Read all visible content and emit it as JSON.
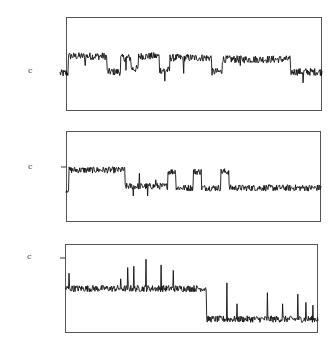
{
  "chart_data": [
    {
      "type": "line",
      "title": "",
      "xlabel": "",
      "ylabel": "",
      "level_label": "c",
      "grid": false,
      "ylim": [
        -1.2,
        1.8
      ],
      "xlim": [
        0,
        250
      ],
      "segments": [
        {
          "from": 0,
          "to": 8,
          "level": 0.0
        },
        {
          "from": 8,
          "to": 45,
          "level": 0.55
        },
        {
          "from": 45,
          "to": 58,
          "level": 0.05
        },
        {
          "from": 58,
          "to": 68,
          "level": 0.5
        },
        {
          "from": 68,
          "to": 75,
          "level": 0.15
        },
        {
          "from": 75,
          "to": 95,
          "level": 0.55
        },
        {
          "from": 95,
          "to": 105,
          "level": 0.1
        },
        {
          "from": 105,
          "to": 145,
          "level": 0.5
        },
        {
          "from": 145,
          "to": 155,
          "level": 0.05
        },
        {
          "from": 155,
          "to": 220,
          "level": 0.45
        },
        {
          "from": 220,
          "to": 250,
          "level": 0.05
        }
      ],
      "noise": 0.12,
      "spikes": [
        {
          "x": 24,
          "value": -0.3
        },
        {
          "x": 63,
          "value": -0.4
        },
        {
          "x": 100,
          "value": -0.35
        },
        {
          "x": 118,
          "value": -0.5
        },
        {
          "x": 172,
          "value": -0.2
        },
        {
          "x": 232,
          "value": -0.35
        }
      ]
    },
    {
      "type": "line",
      "title": "",
      "xlabel": "",
      "ylabel": "",
      "level_label": "c",
      "grid": false,
      "ylim": [
        -1.6,
        1.2
      ],
      "xlim": [
        0,
        250
      ],
      "segments": [
        {
          "from": 0,
          "to": 3,
          "level": -0.6
        },
        {
          "from": 3,
          "to": 58,
          "level": 0.0
        },
        {
          "from": 58,
          "to": 100,
          "level": -0.5
        },
        {
          "from": 100,
          "to": 108,
          "level": -0.05
        },
        {
          "from": 108,
          "to": 125,
          "level": -0.55
        },
        {
          "from": 125,
          "to": 133,
          "level": -0.05
        },
        {
          "from": 133,
          "to": 152,
          "level": -0.55
        },
        {
          "from": 152,
          "to": 160,
          "level": -0.05
        },
        {
          "from": 160,
          "to": 250,
          "level": -0.55
        }
      ],
      "noise": 0.1,
      "spikes": [
        {
          "x": 66,
          "value": -0.3
        },
        {
          "x": 72,
          "value": 0.4
        },
        {
          "x": 80,
          "value": -0.3
        },
        {
          "x": 88,
          "value": 0.2
        }
      ]
    },
    {
      "type": "line",
      "title": "",
      "xlabel": "",
      "ylabel": "",
      "level_label": "c",
      "grid": false,
      "ylim": [
        -2.6,
        0.6
      ],
      "xlim": [
        0,
        250
      ],
      "segments": [
        {
          "from": 0,
          "to": 140,
          "level": -1.0
        },
        {
          "from": 140,
          "to": 250,
          "level": -2.1
        }
      ],
      "noise": 0.12,
      "spikes": [
        {
          "x": 4,
          "value": 0.55
        },
        {
          "x": 55,
          "value": 0.35
        },
        {
          "x": 62,
          "value": 0.75
        },
        {
          "x": 68,
          "value": 0.8
        },
        {
          "x": 80,
          "value": 1.05
        },
        {
          "x": 95,
          "value": 0.85
        },
        {
          "x": 107,
          "value": 0.65
        },
        {
          "x": 160,
          "value": 1.3
        },
        {
          "x": 170,
          "value": 0.55
        },
        {
          "x": 200,
          "value": 0.95
        },
        {
          "x": 215,
          "value": 0.55
        },
        {
          "x": 230,
          "value": 0.9
        },
        {
          "x": 238,
          "value": 0.6
        },
        {
          "x": 245,
          "value": 0.5
        }
      ]
    }
  ]
}
